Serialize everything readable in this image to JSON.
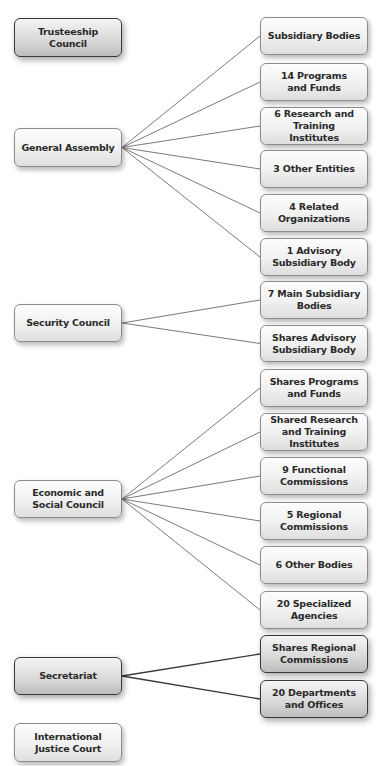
{
  "diagram": {
    "line_color": "#7a7a7a",
    "dark_line_color": "#3a3a3a",
    "organs": [
      {
        "id": "trusteeship",
        "label": "Trusteeship Council",
        "x": 14,
        "y": 18,
        "w": 108,
        "h": 39,
        "style": "dark",
        "children": []
      },
      {
        "id": "general-assembly",
        "label": "General Assembly",
        "x": 14,
        "y": 128,
        "w": 108,
        "h": 39,
        "style": "light",
        "children": [
          "subsidiary-bodies",
          "programs-funds",
          "research-institutes",
          "other-entities",
          "related-orgs",
          "advisory-body"
        ]
      },
      {
        "id": "security-council",
        "label": "Security Council",
        "x": 14,
        "y": 304,
        "w": 108,
        "h": 38,
        "style": "light",
        "children": [
          "main-subsidiary",
          "shares-advisory"
        ]
      },
      {
        "id": "ecosoc",
        "label": "Economic and\nSocial Council",
        "x": 14,
        "y": 480,
        "w": 108,
        "h": 38,
        "style": "light",
        "children": [
          "shares-programs",
          "shared-research",
          "functional-commissions",
          "regional-commissions",
          "other-bodies",
          "specialized-agencies"
        ]
      },
      {
        "id": "secretariat",
        "label": "Secretariat",
        "x": 14,
        "y": 657,
        "w": 108,
        "h": 38,
        "style": "dark",
        "children": [
          "shares-regional",
          "departments-offices"
        ]
      },
      {
        "id": "icj",
        "label": "International\nJustice Court",
        "x": 14,
        "y": 723,
        "w": 108,
        "h": 39,
        "style": "light",
        "children": []
      }
    ],
    "bodies": [
      {
        "id": "subsidiary-bodies",
        "label": "Subsidiary Bodies",
        "x": 260,
        "y": 17,
        "w": 108,
        "h": 38,
        "style": "light"
      },
      {
        "id": "programs-funds",
        "label": "14 Programs\nand Funds",
        "x": 260,
        "y": 63,
        "w": 108,
        "h": 38,
        "style": "light"
      },
      {
        "id": "research-institutes",
        "label": "6 Research and\nTraining Institutes",
        "x": 260,
        "y": 107,
        "w": 108,
        "h": 38,
        "style": "light"
      },
      {
        "id": "other-entities",
        "label": "3 Other Entities",
        "x": 260,
        "y": 150,
        "w": 108,
        "h": 38,
        "style": "light"
      },
      {
        "id": "related-orgs",
        "label": "4 Related\nOrganizations",
        "x": 260,
        "y": 194,
        "w": 108,
        "h": 38,
        "style": "light"
      },
      {
        "id": "advisory-body",
        "label": "1 Advisory\nSubsidiary Body",
        "x": 260,
        "y": 238,
        "w": 108,
        "h": 38,
        "style": "light"
      },
      {
        "id": "main-subsidiary",
        "label": "7 Main Subsidiary\nBodies",
        "x": 260,
        "y": 281,
        "w": 108,
        "h": 38,
        "style": "light"
      },
      {
        "id": "shares-advisory",
        "label": "Shares Advisory\nSubsidiary Body",
        "x": 260,
        "y": 325,
        "w": 108,
        "h": 37,
        "style": "light"
      },
      {
        "id": "shares-programs",
        "label": "Shares Programs\nand Funds",
        "x": 260,
        "y": 369,
        "w": 108,
        "h": 38,
        "style": "light"
      },
      {
        "id": "shared-research",
        "label": "Shared Research\nand Training\nInstitutes",
        "x": 260,
        "y": 413,
        "w": 108,
        "h": 38,
        "style": "light"
      },
      {
        "id": "functional-commissions",
        "label": "9 Functional\nCommissions",
        "x": 260,
        "y": 457,
        "w": 108,
        "h": 38,
        "style": "light"
      },
      {
        "id": "regional-commissions",
        "label": "5 Regional\nCommissions",
        "x": 260,
        "y": 502,
        "w": 108,
        "h": 38,
        "style": "light"
      },
      {
        "id": "other-bodies",
        "label": "6 Other Bodies",
        "x": 260,
        "y": 546,
        "w": 108,
        "h": 38,
        "style": "light"
      },
      {
        "id": "specialized-agencies",
        "label": "20 Specialized\nAgencies",
        "x": 260,
        "y": 591,
        "w": 108,
        "h": 38,
        "style": "light"
      },
      {
        "id": "shares-regional",
        "label": "Shares Regional\nCommissions",
        "x": 260,
        "y": 635,
        "w": 108,
        "h": 38,
        "style": "dark"
      },
      {
        "id": "departments-offices",
        "label": "20 Departments\nand Offices",
        "x": 260,
        "y": 680,
        "w": 108,
        "h": 38,
        "style": "dark"
      }
    ]
  }
}
